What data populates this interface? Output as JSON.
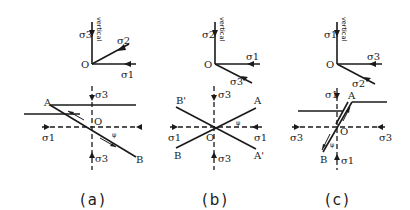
{
  "figure": {
    "panels": [
      {
        "caption": "(a)",
        "top": {
          "origin_label": "O",
          "vertical_label": "vertical",
          "vertical_stress": "σ3",
          "horizontal_stress": "σ1",
          "diagonal_stress": "σ2"
        },
        "bottom": {
          "center_label": "O",
          "point_a": "A",
          "point_b": "B",
          "angle_label": "ψ",
          "left_stress": "σ1",
          "right_stress": "σ1",
          "top_stress": "σ3",
          "bottom_stress": "σ3"
        }
      },
      {
        "caption": "(b)",
        "top": {
          "origin_label": "O",
          "vertical_label": "vertical",
          "vertical_stress": "σ2",
          "horizontal_stress": "σ1",
          "diagonal_stress": "σ3"
        },
        "bottom": {
          "center_label": "O",
          "point_a": "A",
          "point_b": "B",
          "point_a_prime": "A'",
          "point_b_prime": "B'",
          "angle_label": "ψ",
          "left_stress": "σ1",
          "right_stress": "σ1",
          "top_stress": "σ3",
          "bottom_stress": "σ3"
        }
      },
      {
        "caption": "(c)",
        "top": {
          "origin_label": "O",
          "vertical_label": "vertical",
          "vertical_stress": "σ1",
          "horizontal_stress": "σ3",
          "diagonal_stress": "σ2"
        },
        "bottom": {
          "center_label": "O",
          "point_a": "A",
          "point_b": "B",
          "angle_label": "ψ",
          "left_stress": "σ3",
          "right_stress": "σ3",
          "top_stress": "σ1",
          "bottom_stress": "σ1"
        }
      }
    ]
  }
}
